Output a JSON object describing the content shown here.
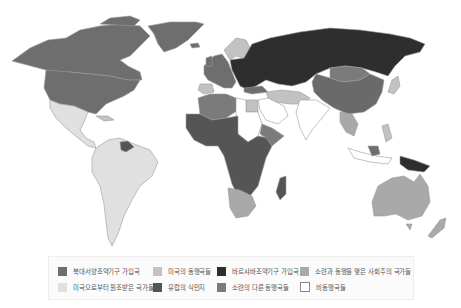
{
  "map": {
    "title": "",
    "colors": {
      "nato": "#6e6e6e",
      "us_allies": "#c2c2c2",
      "warsaw_pact": "#2e2e2e",
      "soviet_allied_socialist": "#a9a9a9",
      "us_aided": "#e0e0e0",
      "european_colonies": "#555555",
      "other_soviet_allies": "#7b7b7b",
      "non_aligned": "#ffffff",
      "border": "#9a9a9a"
    }
  },
  "legend": {
    "items": [
      {
        "label": "북대서양조약기구 가입국",
        "color": "#6e6e6e"
      },
      {
        "label": "미국의 동맹국들",
        "color": "#c2c2c2"
      },
      {
        "label": "바르샤바조약기구 가입국",
        "color": "#2e2e2e"
      },
      {
        "label": "소련과 동맹을 맺은 사회주의 국가들",
        "color": "#a9a9a9"
      },
      {
        "label": "미국으로부터 원조받은 국가들",
        "color": "#e0e0e0"
      },
      {
        "label": "유럽의 식민지",
        "color": "#555555"
      },
      {
        "label": "소련의 다른 동맹국들",
        "color": "#7b7b7b"
      },
      {
        "label": "비동맹국들",
        "color": "#ffffff"
      }
    ]
  }
}
